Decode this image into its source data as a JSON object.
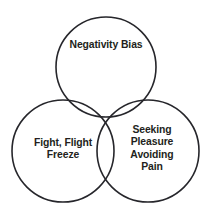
{
  "diagram": {
    "type": "venn-3-circle",
    "title": "",
    "background_color": "#ffffff",
    "stroke_color": "#26262b",
    "text_color": "#231f20",
    "circles": [
      {
        "id": "top",
        "label": "Negativity Bias",
        "cx": 106,
        "cy": 67,
        "r": 50
      },
      {
        "id": "bottom-left",
        "label": "Fight, Flight\nFreeze",
        "cx": 63,
        "cy": 151,
        "r": 51
      },
      {
        "id": "bottom-right",
        "label": "Seeking\nPleasure\nAvoiding\nPain",
        "cx": 148,
        "cy": 151,
        "r": 51
      }
    ]
  }
}
